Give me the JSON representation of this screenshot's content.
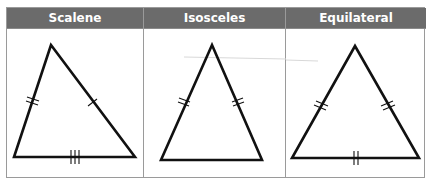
{
  "table": {
    "columns": [
      {
        "header": "Scalene",
        "width": 137,
        "triangle": {
          "points": [
            [
              44,
              16
            ],
            [
              7,
              128
            ],
            [
              128,
              128
            ]
          ],
          "side_marks": [
            {
              "side": "left",
              "ticks": 2
            },
            {
              "side": "right",
              "ticks": 1
            },
            {
              "side": "base",
              "ticks": 3
            }
          ]
        }
      },
      {
        "header": "Isosceles",
        "width": 142,
        "triangle": {
          "points": [
            [
              68,
              16
            ],
            [
              17,
              131
            ],
            [
              118,
              131
            ]
          ],
          "side_marks": [
            {
              "side": "left",
              "ticks": 2
            },
            {
              "side": "right",
              "ticks": 2
            },
            {
              "side": "base",
              "ticks": 0
            }
          ]
        }
      },
      {
        "header": "Equilateral",
        "width": 140,
        "triangle": {
          "points": [
            [
              69,
              17
            ],
            [
              6,
              129
            ],
            [
              133,
              129
            ]
          ],
          "side_marks": [
            {
              "side": "left",
              "ticks": 2
            },
            {
              "side": "right",
              "ticks": 2
            },
            {
              "side": "base",
              "ticks": 2
            }
          ]
        }
      }
    ]
  },
  "colors": {
    "header_bg": "#6b6b6b",
    "header_text": "#ffffff",
    "border": "#9a9a9a",
    "stroke": "#111111"
  }
}
